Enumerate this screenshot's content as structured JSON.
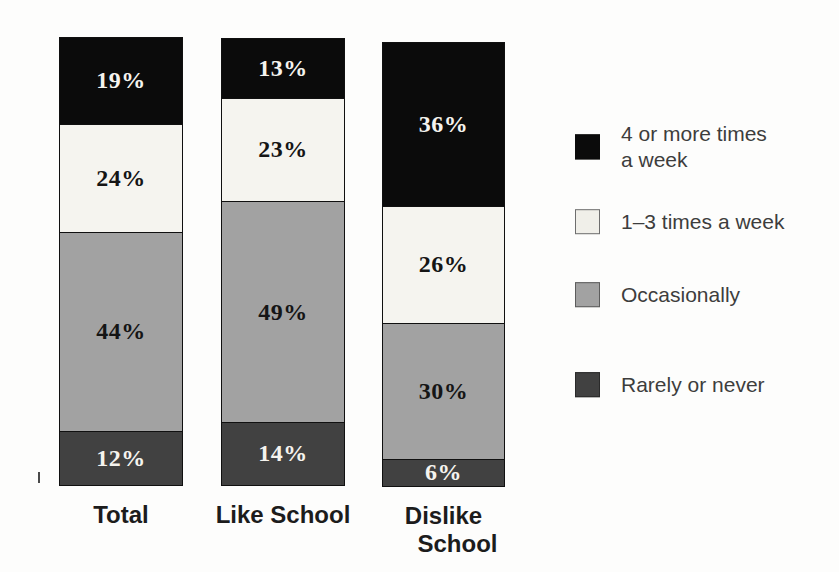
{
  "chart_data": {
    "type": "bar",
    "variant": "stacked-column",
    "title": "",
    "xlabel": "",
    "ylabel": "",
    "ylim": [
      0,
      100
    ],
    "grid": false,
    "axes_visible": false,
    "legend_position": "right",
    "value_suffix": "%",
    "categories": [
      "Total",
      "Like School",
      "Dislike School"
    ],
    "category_lines": [
      [
        "Total"
      ],
      [
        "Like School"
      ],
      [
        "Dislike",
        "School"
      ]
    ],
    "series": [
      {
        "name": "4 or more times a week",
        "color": "#0b0b0b",
        "label_color": "#f5f3ee",
        "values": [
          19,
          13,
          36
        ]
      },
      {
        "name": "1–3 times a week",
        "color": "#f5f4ef",
        "label_color": "#151515",
        "values": [
          24,
          23,
          26
        ]
      },
      {
        "name": "Occasionally",
        "color": "#a2a2a2",
        "label_color": "#151515",
        "values": [
          44,
          49,
          30
        ]
      },
      {
        "name": "Rarely or never",
        "color": "#414141",
        "label_color": "#f5f3ee",
        "values": [
          12,
          14,
          6
        ]
      }
    ]
  },
  "legend": {
    "items": [
      {
        "label": "4 or more times a week",
        "label_lines": [
          "4 or more times",
          "a week"
        ],
        "color": "#0b0b0b",
        "border": "#0b0b0b"
      },
      {
        "label": "1–3 times a week",
        "label_lines": [
          "1–3 times a week"
        ],
        "color": "#f0efe9",
        "border": "#6e6e6e"
      },
      {
        "label": "Occasionally",
        "label_lines": [
          "Occasionally"
        ],
        "color": "#a2a2a2",
        "border": "#5c5c5c"
      },
      {
        "label": "Rarely or never",
        "label_lines": [
          "Rarely or never"
        ],
        "color": "#414141",
        "border": "#2a2a2a"
      }
    ]
  }
}
